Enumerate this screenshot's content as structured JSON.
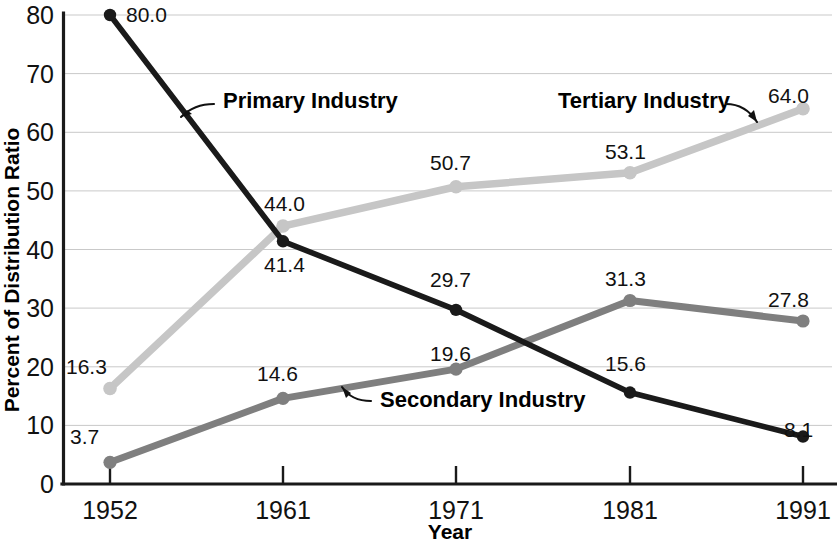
{
  "chart_data": {
    "type": "line",
    "title": "",
    "xlabel": "Year",
    "ylabel": "Percent of Distribution Ratio",
    "categories": [
      "1952",
      "1961",
      "1971",
      "1981",
      "1991"
    ],
    "x": [
      1952,
      1961,
      1971,
      1981,
      1991
    ],
    "xlim": [
      1952,
      1991
    ],
    "ylim": [
      0,
      80
    ],
    "yticks": [
      "0",
      "10",
      "20",
      "30",
      "40",
      "50",
      "60",
      "70",
      "80"
    ],
    "ytick_values": [
      0,
      10,
      20,
      30,
      40,
      50,
      60,
      70,
      80
    ],
    "grid": "horizontal",
    "legend": "inline-annotations",
    "series": [
      {
        "name": "Primary Industry",
        "color": "#1a1a1a",
        "values": [
          80.0,
          41.4,
          29.7,
          15.6,
          8.1
        ],
        "labels": [
          "80.0",
          "41.4",
          "29.7",
          "15.6",
          "8.1"
        ]
      },
      {
        "name": "Secondary Industry",
        "color": "#7f7f7f",
        "values": [
          3.7,
          14.6,
          19.6,
          31.3,
          27.8
        ],
        "labels": [
          "3.7",
          "14.6",
          "19.6",
          "31.3",
          "27.8"
        ]
      },
      {
        "name": "Tertiary Industry",
        "color": "#c6c6c6",
        "values": [
          16.3,
          44.0,
          50.7,
          53.1,
          64.0
        ],
        "labels": [
          "16.3",
          "44.0",
          "50.7",
          "53.1",
          "64.0"
        ]
      }
    ],
    "annotations": [
      {
        "text": "Primary Industry",
        "series": "Primary Industry"
      },
      {
        "text": "Secondary Industry",
        "series": "Secondary Industry"
      },
      {
        "text": "Tertiary Industry",
        "series": "Tertiary Industry"
      }
    ]
  }
}
